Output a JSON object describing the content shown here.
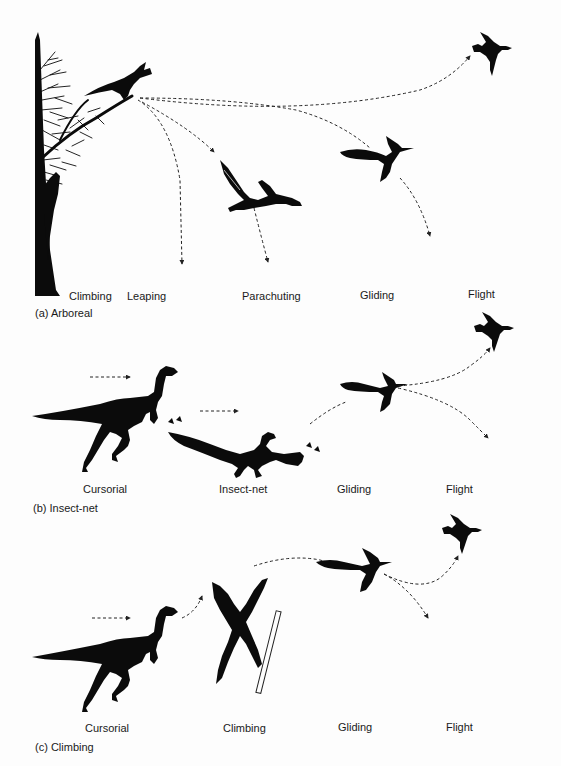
{
  "panels": [
    {
      "id": "a",
      "title": "(a) Arboreal",
      "stages": [
        "Climbing",
        "Leaping",
        "Parachuting",
        "Gliding",
        "Flight"
      ]
    },
    {
      "id": "b",
      "title": "(b) Insect-net",
      "stages": [
        "Cursorial",
        "Insect-net",
        "Gliding",
        "Flight"
      ]
    },
    {
      "id": "c",
      "title": "(c) Climbing",
      "stages": [
        "Cursorial",
        "Climbing",
        "Gliding",
        "Flight"
      ]
    }
  ],
  "figures": {
    "tree": "tree-silhouette",
    "leaping_dinosaur": "leaping-dinosaur-silhouette",
    "parachuting_animal": "parachuting-animal-silhouette",
    "gliding_animal": "gliding-animal-silhouette",
    "flying_bird": "flying-bird-silhouette",
    "cursorial_dinosaur": "cursorial-dinosaur-silhouette",
    "insect_net_dinosaur": "insect-net-dinosaur-silhouette",
    "climbing_animal": "climbing-animal-silhouette",
    "insects": "insect-marks"
  },
  "colors": {
    "ink": "#0b0b0b",
    "paper": "#fdfdfd",
    "arrow": "#222222"
  }
}
